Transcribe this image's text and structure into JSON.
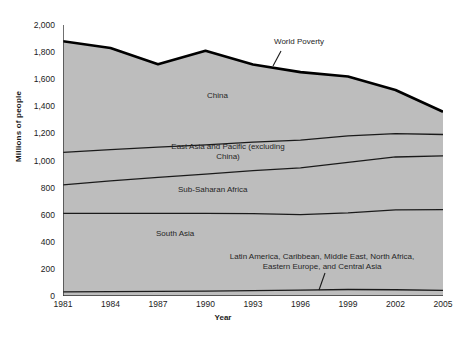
{
  "chart_data": {
    "type": "area",
    "title": "",
    "xlabel": "Year",
    "ylabel": "Millions of people",
    "stacked": true,
    "grid": false,
    "legend_position": "inline-annotations",
    "xlim": [
      1981,
      2005
    ],
    "ylim": [
      0,
      2000
    ],
    "ytick_labels": [
      "0",
      "200",
      "400",
      "600",
      "800",
      "1,000",
      "1,200",
      "1,400",
      "1,600",
      "1,800",
      "2,000"
    ],
    "ytick_values": [
      0,
      200,
      400,
      600,
      800,
      1000,
      1200,
      1400,
      1600,
      1800,
      2000
    ],
    "xtick_labels": [
      "1981",
      "1984",
      "1987",
      "1990",
      "1993",
      "1996",
      "1999",
      "2002",
      "2005"
    ],
    "xtick_values": [
      1981,
      1984,
      1987,
      1990,
      1993,
      1996,
      1999,
      2002,
      2005
    ],
    "x": [
      1981,
      1984,
      1987,
      1990,
      1993,
      1996,
      1999,
      2002,
      2005
    ],
    "series": [
      {
        "name": "Latin America, Caribbean, Middle East, North Africa, Eastern Europe, and Central Asia",
        "values": [
          30,
          32,
          34,
          36,
          40,
          44,
          48,
          46,
          42
        ]
      },
      {
        "name": "South Asia",
        "values": [
          580,
          578,
          576,
          574,
          568,
          556,
          566,
          590,
          596
        ]
      },
      {
        "name": "Sub-Saharan Africa",
        "values": [
          210,
          240,
          266,
          290,
          318,
          346,
          372,
          390,
          396
        ]
      },
      {
        "name": "East Asia and Pacific (excluding China)",
        "values": [
          240,
          230,
          222,
          216,
          210,
          204,
          196,
          172,
          158
        ]
      },
      {
        "name": "China",
        "values": [
          820,
          750,
          612,
          694,
          572,
          502,
          438,
          322,
          168
        ]
      }
    ],
    "top_line": {
      "name": "World Poverty",
      "values": [
        1880,
        1830,
        1710,
        1810,
        1708,
        1652,
        1620,
        1520,
        1360
      ]
    },
    "annotations": [
      {
        "text": "World Poverty",
        "leader_line": true
      },
      {
        "text": "China"
      },
      {
        "text": "East Asia and Pacific (excluding",
        "text2": "China)"
      },
      {
        "text": "Sub-Saharan Africa"
      },
      {
        "text": "South Asia"
      },
      {
        "text": "Latin America, Caribbean, Middle East, North Africa,",
        "text2": "Eastern Europe, and Central Asia",
        "leader_line": true
      }
    ],
    "colors": {
      "area_fill": "#bdbdbd",
      "band_line": "#1a1a1a",
      "top_line": "#000000",
      "axis": "#333333",
      "background": "#ffffff",
      "text": "#1c1c1c"
    }
  },
  "annotations": {
    "world_poverty": "World Poverty",
    "china": "China",
    "east_asia_line1": "East Asia and Pacific (excluding",
    "east_asia_line2": "China)",
    "sub_saharan": "Sub-Saharan Africa",
    "south_asia": "South Asia",
    "latin_line1": "Latin America, Caribbean, Middle East, North Africa,",
    "latin_line2": "Eastern Europe, and Central Asia"
  },
  "axes": {
    "y_title": "Millions of people",
    "x_title": "Year"
  },
  "caption": {
    "text": ""
  }
}
